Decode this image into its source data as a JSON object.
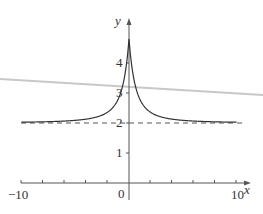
{
  "chart_data": {
    "type": "line",
    "title": "",
    "xlabel": "x",
    "ylabel": "y",
    "xlim": [
      -10,
      10
    ],
    "ylim": [
      0,
      5
    ],
    "x_ticks_labeled": [
      "-10",
      "0",
      "10"
    ],
    "y_ticks_labeled": [
      "1",
      "2",
      "3",
      "4"
    ],
    "grid": false,
    "legend": null,
    "series": [
      {
        "name": "curve",
        "style": "solid",
        "x": [
          -10,
          -8,
          -6,
          -4,
          -3,
          -2,
          -1.5,
          -1,
          -0.5,
          0,
          0.5,
          1,
          1.5,
          2,
          3,
          4,
          6,
          8,
          10
        ],
        "values": [
          2.05,
          2.07,
          2.12,
          2.22,
          2.33,
          2.5,
          2.7,
          3.0,
          3.6,
          4.8,
          3.6,
          3.0,
          2.7,
          2.5,
          2.33,
          2.22,
          2.12,
          2.07,
          2.05
        ]
      },
      {
        "name": "horizontal asymptote y=2",
        "style": "dashed",
        "x": [
          -10,
          10
        ],
        "values": [
          2,
          2
        ]
      }
    ],
    "annotations": [
      "dashed asymptote at y = 2",
      "peak near y ≈ 4.8 at x = 0"
    ]
  },
  "axes": {
    "x_label": "x",
    "y_label": "y",
    "x_min_label": "−10",
    "x_max_label": "10",
    "origin_label": "0",
    "y_tick_labels": [
      "1",
      "2",
      "3",
      "4"
    ]
  }
}
